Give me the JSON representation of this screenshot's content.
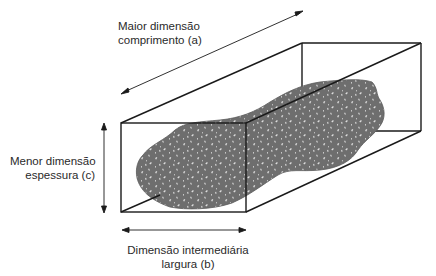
{
  "diagram": {
    "title": "",
    "labels": {
      "length": {
        "line1": "Maior dimensão",
        "line2": "comprimento (a)"
      },
      "thickness": {
        "line1": "Menor dimensão",
        "line2": "espessura (c)"
      },
      "width": {
        "line1": "Dimensão intermediária",
        "line2": "largura (b)"
      }
    },
    "shapes": {
      "box": "rectangular prism (bounding box)",
      "particle": "irregular elongated rock particle, speckled gray texture"
    },
    "colors": {
      "particle_fill": "#6e6e6e",
      "particle_speckle": "#d8d8d8",
      "lines": "#1a1a1a",
      "text": "#2a2a2a"
    }
  }
}
